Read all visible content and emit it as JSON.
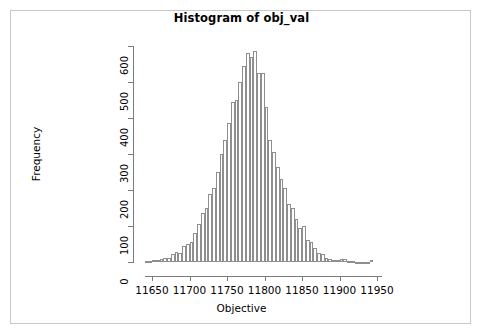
{
  "frame": {
    "border_color": "#c8c8c8",
    "background": "#ffffff"
  },
  "chart_data": {
    "type": "bar",
    "subtype": "histogram",
    "title": "Histogram of obj_val",
    "xlabel": "Objective",
    "ylabel": "Frequency",
    "xlim": [
      11640,
      11950
    ],
    "ylim": [
      0,
      600
    ],
    "grid": false,
    "legend": null,
    "bin_width": 5,
    "bar_fill": "#ffffff",
    "bar_border": "#8e8e8e",
    "axis_color": "#7a7a7a",
    "xticks": [
      11650,
      11700,
      11750,
      11800,
      11850,
      11900,
      11950
    ],
    "xtick_labels": [
      "11650",
      "11700",
      "11750",
      "11800",
      "11850",
      "11900",
      "11950"
    ],
    "yticks": [
      0,
      100,
      200,
      300,
      400,
      500,
      600
    ],
    "ytick_labels": [
      "0",
      "100",
      "200",
      "300",
      "400",
      "500",
      "600"
    ],
    "bin_starts": [
      11640,
      11645,
      11650,
      11655,
      11660,
      11665,
      11670,
      11675,
      11680,
      11685,
      11690,
      11695,
      11700,
      11705,
      11710,
      11715,
      11720,
      11725,
      11730,
      11735,
      11740,
      11745,
      11750,
      11755,
      11760,
      11765,
      11770,
      11775,
      11780,
      11785,
      11790,
      11795,
      11800,
      11805,
      11810,
      11815,
      11820,
      11825,
      11830,
      11835,
      11840,
      11845,
      11850,
      11855,
      11860,
      11865,
      11870,
      11875,
      11880,
      11885,
      11890,
      11895,
      11900,
      11905,
      11910,
      11915,
      11920,
      11925,
      11930,
      11935,
      11940
    ],
    "categories": [
      "11640",
      "11645",
      "11650",
      "11655",
      "11660",
      "11665",
      "11670",
      "11675",
      "11680",
      "11685",
      "11690",
      "11695",
      "11700",
      "11705",
      "11710",
      "11715",
      "11720",
      "11725",
      "11730",
      "11735",
      "11740",
      "11745",
      "11750",
      "11755",
      "11760",
      "11765",
      "11770",
      "11775",
      "11780",
      "11785",
      "11790",
      "11795",
      "11800",
      "11805",
      "11810",
      "11815",
      "11820",
      "11825",
      "11830",
      "11835",
      "11840",
      "11845",
      "11850",
      "11855",
      "11860",
      "11865",
      "11870",
      "11875",
      "11880",
      "11885",
      "11890",
      "11895",
      "11900",
      "11905",
      "11910",
      "11915",
      "11920",
      "11925",
      "11930",
      "11935",
      "11940"
    ],
    "values": [
      3,
      2,
      5,
      6,
      8,
      10,
      12,
      22,
      28,
      25,
      45,
      50,
      55,
      80,
      105,
      135,
      150,
      190,
      205,
      250,
      300,
      340,
      385,
      445,
      450,
      500,
      545,
      580,
      570,
      585,
      525,
      525,
      430,
      340,
      305,
      265,
      230,
      205,
      160,
      150,
      120,
      95,
      100,
      60,
      55,
      40,
      25,
      22,
      12,
      8,
      6,
      5,
      8,
      7,
      3,
      2,
      1,
      1,
      1,
      1,
      5
    ]
  }
}
